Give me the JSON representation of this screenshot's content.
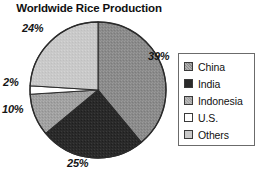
{
  "chart_data": {
    "type": "pie",
    "title": "Worldwide Rice Production",
    "categories": [
      "China",
      "India",
      "Indonesia",
      "U.S.",
      "Others"
    ],
    "values": [
      39,
      25,
      10,
      2,
      24
    ],
    "value_labels": [
      "39%",
      "25%",
      "10%",
      "2%",
      "24%"
    ],
    "unit": "%",
    "xlabel": "",
    "ylabel": "",
    "legend_position": "right",
    "grid": false,
    "start_angle_deg": 0,
    "direction": "clockwise",
    "slice_colors": [
      "#8a8a8a",
      "#2a2a2a",
      "#a0a0a0",
      "#ffffff",
      "#c9c9c9"
    ],
    "slice_edge_color": "#2b2b2b",
    "background": "#ffffff"
  },
  "title": {
    "text": "Worldwide Rice Production"
  },
  "labels": {
    "china": "39%",
    "india": "25%",
    "indonesia": "10%",
    "us": "2%",
    "others": "24%"
  },
  "legend": {
    "items": [
      {
        "label": "China",
        "swatch": "swatch-china-medium-gray"
      },
      {
        "label": "India",
        "swatch": "swatch-india-dark"
      },
      {
        "label": "Indonesia",
        "swatch": "swatch-indonesia-gray"
      },
      {
        "label": "U.S.",
        "swatch": "swatch-us-white"
      },
      {
        "label": "Others",
        "swatch": "swatch-others-light-gray"
      }
    ]
  }
}
